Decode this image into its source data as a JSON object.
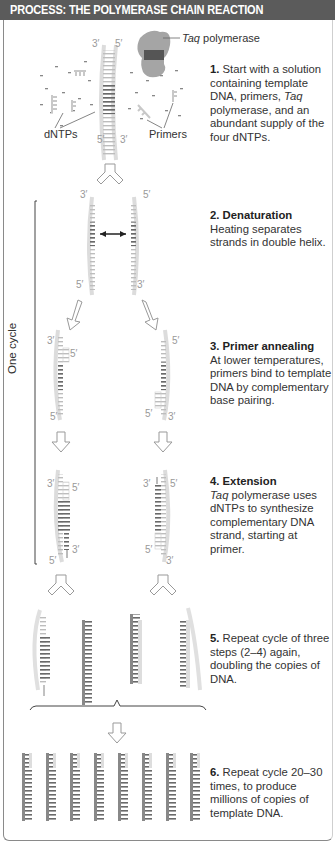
{
  "header": {
    "title": "PROCESS: THE POLYMERASE CHAIN REACTION",
    "background": "#5b5b5b"
  },
  "labels": {
    "taq_polymerase_italic": "Taq",
    "taq_polymerase_rest": " polymerase",
    "dntps": "dNTPs",
    "primers": "Primers",
    "one_cycle": "One cycle",
    "prime3": "3′",
    "prime5": "5′"
  },
  "steps": [
    {
      "number": "1.",
      "title": "",
      "text_a": "Start with a solution containing template DNA, primers, ",
      "italic": "Taq",
      "text_b": " polymerase, and an abundant supply of the four dNTPs."
    },
    {
      "number": "2.",
      "title": "Denaturation",
      "text": "Heating separates strands in double helix."
    },
    {
      "number": "3.",
      "title": "Primer annealing",
      "text": "At lower temperatures, primers bind to template DNA by complementary base pairing."
    },
    {
      "number": "4.",
      "title": "Extension",
      "italic": "Taq",
      "text": " polymerase uses dNTPs to synthesize complementary DNA strand, starting at primer."
    },
    {
      "number": "5.",
      "title": "",
      "text": "Repeat cycle of three steps (2–4) again, doubling the copies of DNA."
    },
    {
      "number": "6.",
      "title": "",
      "text": "Repeat cycle 20–30 times, to produce millions of copies of template DNA."
    }
  ],
  "colors": {
    "strand_light": "#d8d8d8",
    "strand_dark": "#6e6e6e",
    "polymerase": "#9a9a9a",
    "text": "#333333"
  }
}
